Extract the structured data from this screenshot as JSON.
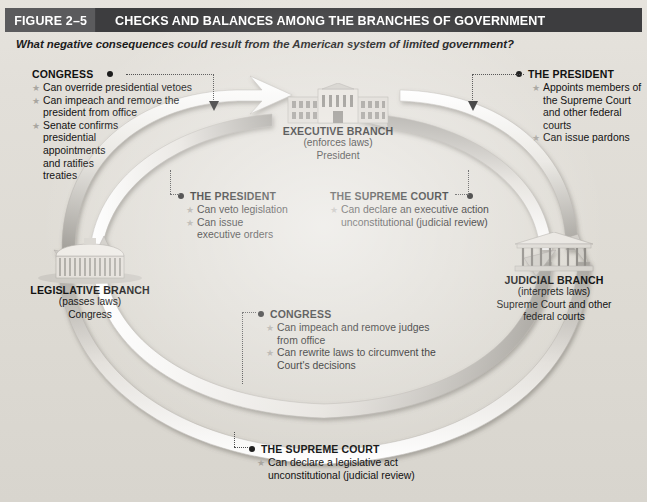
{
  "figure": {
    "number": "FIGURE 2–5",
    "title": "CHECKS AND BALANCES AMONG THE BRANCHES OF GOVERNMENT",
    "subtitle": "What negative consequences could result from the American system of limited government?",
    "header_bg": "#3d3d3f",
    "number_bg": "#5b5b5d",
    "page_bg": "#e2dfd9"
  },
  "branches": {
    "executive": {
      "name": "EXECUTIVE BRANCH",
      "role": "(enforces laws)",
      "holder": "President",
      "icon": "white-house-icon"
    },
    "legislative": {
      "name": "LEGISLATIVE BRANCH",
      "role": "(passes laws)",
      "holder": "Congress",
      "icon": "capitol-dome-icon"
    },
    "judicial": {
      "name": "JUDICIAL BRANCH",
      "role": "(interprets laws)",
      "holder_line1": "Supreme Court and other",
      "holder_line2": "federal courts",
      "icon": "supreme-court-icon"
    }
  },
  "callouts": {
    "congress_over_president": {
      "heading": "CONGRESS",
      "items": [
        "Can override presidential vetoes",
        "Can impeach and remove the president from office",
        "Senate confirms presidential appointments and ratifies treaties"
      ]
    },
    "president_over_judicial": {
      "heading": "THE PRESIDENT",
      "items": [
        "Appoints members of the Supreme Court and other federal courts",
        "Can issue pardons"
      ]
    },
    "president_over_congress": {
      "heading": "THE PRESIDENT",
      "items": [
        "Can veto legislation",
        "Can issue executive orders"
      ]
    },
    "supreme_over_president": {
      "heading": "THE SUPREME COURT",
      "items": [
        "Can declare an executive action unconstitutional (judicial review)"
      ]
    },
    "congress_over_judicial": {
      "heading": "CONGRESS",
      "items": [
        "Can impeach and remove judges from office",
        "Can rewrite laws to circumvent the Court's decisions"
      ]
    },
    "supreme_over_congress": {
      "heading": "THE SUPREME COURT",
      "items": [
        "Can declare a legislative act unconstitutional (judicial review)"
      ]
    }
  }
}
